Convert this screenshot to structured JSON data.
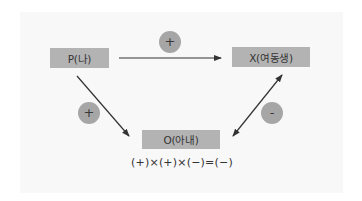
{
  "diagram": {
    "nodes": {
      "p": {
        "label": "P(나)"
      },
      "x": {
        "label": "X(여동생)"
      },
      "o": {
        "label": "O(아내)"
      }
    },
    "edges": [
      {
        "from": "P",
        "to": "X",
        "sign": "+",
        "direction": "one-way"
      },
      {
        "from": "P",
        "to": "O",
        "sign": "+",
        "direction": "one-way"
      },
      {
        "from": "X",
        "to": "O",
        "sign": "-",
        "direction": "two-way"
      }
    ],
    "signs": {
      "top": "+",
      "left": "+",
      "right": "-"
    },
    "equation": "(+)×(+)×(−)=(−)",
    "colors": {
      "node_fill": "#b3b3b3",
      "sign_fill": "#a6a6a6",
      "arrow": "#333333",
      "panel": "#f8f8f8"
    }
  }
}
